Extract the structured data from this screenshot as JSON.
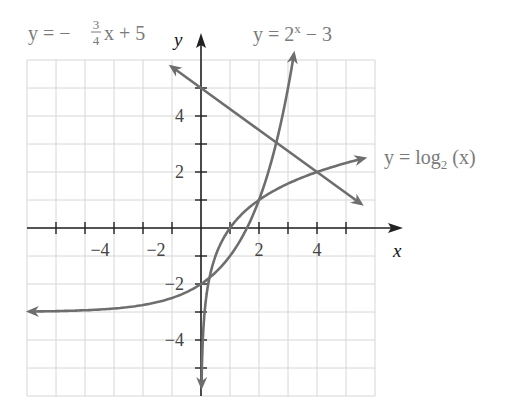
{
  "chart_data": {
    "type": "line",
    "title": "",
    "xlabel": "x",
    "ylabel": "y",
    "xlim": [
      -6,
      6
    ],
    "ylim": [
      -6,
      6
    ],
    "grid": true,
    "x_ticks": [
      -4,
      -2,
      2,
      4
    ],
    "y_ticks": [
      4,
      2,
      -2,
      -4
    ],
    "series": [
      {
        "name": "y = -3/4 x + 5",
        "label": {
          "y": "y",
          "eq": "=",
          "neg": "−",
          "num": "3",
          "den": "4",
          "rest": "x + 5"
        },
        "points": [
          [
            -1,
            5.75
          ],
          [
            0,
            5
          ],
          [
            2,
            3.5
          ],
          [
            4,
            2
          ],
          [
            5.5,
            0.875
          ]
        ],
        "arrows": "both"
      },
      {
        "name": "y = 2^x - 3",
        "label": {
          "base": "y = 2",
          "exp": "x",
          "rest": " − 3"
        },
        "points": [
          [
            -5.9,
            -2.98
          ],
          [
            -4,
            -2.94
          ],
          [
            -2,
            -2.75
          ],
          [
            -1,
            -2.5
          ],
          [
            0,
            -2
          ],
          [
            1,
            -1
          ],
          [
            2,
            1
          ],
          [
            2.5,
            2.66
          ],
          [
            3,
            5
          ],
          [
            3.2,
            6.19
          ]
        ],
        "arrows": "both"
      },
      {
        "name": "y = log2(x)",
        "label": {
          "base": "y = log",
          "sub": "2",
          "rest": " (x)"
        },
        "points": [
          [
            0.02,
            -5.64
          ],
          [
            0.125,
            -3
          ],
          [
            0.25,
            -2
          ],
          [
            0.5,
            -1
          ],
          [
            1,
            0
          ],
          [
            2,
            1
          ],
          [
            4,
            2
          ],
          [
            5.6,
            2.49
          ]
        ],
        "arrows": "both"
      }
    ],
    "annotations": [
      "y = −(3/4)x + 5",
      "y = 2^x − 3",
      "y = log₂ (x)"
    ]
  },
  "labels": {
    "x_axis": "x",
    "y_axis": "y",
    "ticks_x": [
      "−4",
      "−2",
      "2",
      "4"
    ],
    "ticks_y": [
      "4",
      "2",
      "−2",
      "−4"
    ],
    "line_eq": {
      "y": "y = −",
      "num": "3",
      "den": "4",
      "rest": "x + 5"
    },
    "exp_eq": {
      "base": "y = 2",
      "exp": "x",
      "rest": " − 3"
    },
    "log_eq": {
      "base": "y = log",
      "sub": "2",
      "rest": " (x)"
    }
  },
  "colors": {
    "curve": "#6e6e6e",
    "grid": "#d6d6d6",
    "axis": "#222222",
    "label": "#7a7a7a"
  }
}
